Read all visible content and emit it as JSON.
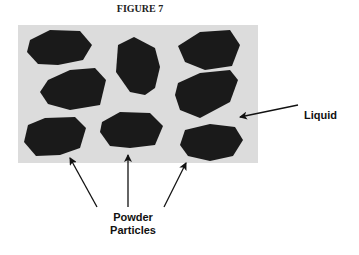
{
  "figure": {
    "title": "FIGURE 7",
    "background_color": "#dcdcdc",
    "particle_color": "#1a1a1a"
  },
  "labels": {
    "liquid": "Liquid",
    "powder_line1": "Powder",
    "powder_line2": "Particles"
  },
  "particles": [
    {
      "id": 1,
      "points": "30,40 50,30 80,31 92,45 83,60 58,65 38,64 27,52"
    },
    {
      "id": 2,
      "points": "118,45 134,37 155,48 160,67 155,88 145,95 130,92 116,72"
    },
    {
      "id": 3,
      "points": "178,46 200,32 230,30 240,45 232,66 205,70 185,62"
    },
    {
      "id": 4,
      "points": "48,80 70,70 95,68 106,80 100,105 70,110 48,104 40,92"
    },
    {
      "id": 5,
      "points": "178,83 200,73 230,70 238,80 230,102 200,118 180,110 175,95"
    },
    {
      "id": 6,
      "points": "28,125 45,118 75,117 86,128 80,148 60,155 36,156 24,142"
    },
    {
      "id": 7,
      "points": "102,122 120,112 150,113 163,126 155,145 130,148 110,146 100,132"
    },
    {
      "id": 8,
      "points": "185,130 210,124 235,127 243,140 233,156 210,161 188,156 180,145"
    }
  ]
}
